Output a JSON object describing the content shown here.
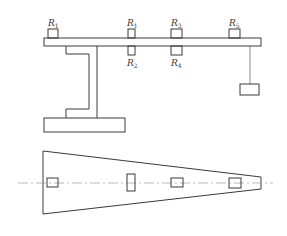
{
  "diagram": {
    "type": "engineering-drawing",
    "elevation_view": {
      "labels": [
        {
          "id": "left",
          "base": "R",
          "sub": "1",
          "x": 48,
          "y": 26
        },
        {
          "id": "mid-top",
          "base": "R",
          "sub": "1",
          "x": 127,
          "y": 26
        },
        {
          "id": "mid-bottom",
          "base": "R",
          "sub": "2",
          "x": 127,
          "y": 66
        },
        {
          "id": "r3",
          "base": "R",
          "sub": "3",
          "x": 171,
          "y": 26
        },
        {
          "id": "r4",
          "base": "R",
          "sub": "4",
          "x": 171,
          "y": 66
        },
        {
          "id": "r5",
          "base": "R",
          "sub": "5",
          "x": 229,
          "y": 26
        }
      ]
    },
    "plan_view": {
      "shape": "tapered beam (trapezoid) with centerline and 4 gauge locations"
    },
    "colors": {
      "line": "#3a3a3a",
      "centerline": "#8a8a8a",
      "background": "#ffffff"
    }
  }
}
